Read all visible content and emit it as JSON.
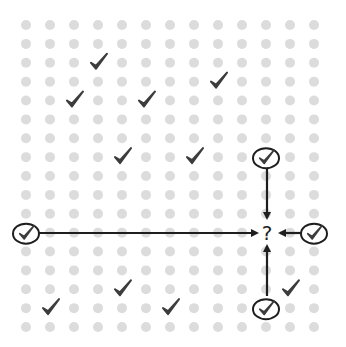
{
  "diagram": {
    "width": 346,
    "height": 347,
    "grid": {
      "cols": 13,
      "rows": 17,
      "x0": 26,
      "dx": 24,
      "y0": 25,
      "dy": 18.875,
      "dot_radius": 5,
      "dot_color": "#dcdcdc"
    },
    "check_color": "#3c3c3c",
    "line_color": "#1e1e1e",
    "checks": [
      {
        "col": 3,
        "row": 2
      },
      {
        "col": 2,
        "row": 4
      },
      {
        "col": 5,
        "row": 4
      },
      {
        "col": 8,
        "row": 3
      },
      {
        "col": 4,
        "row": 7
      },
      {
        "col": 7,
        "row": 7
      },
      {
        "col": 4,
        "row": 14
      },
      {
        "col": 1,
        "row": 15
      },
      {
        "col": 6,
        "row": 15
      },
      {
        "col": 11,
        "row": 14
      }
    ],
    "circled_checks": [
      {
        "id": "top",
        "col": 10,
        "row": 7
      },
      {
        "id": "left",
        "col": 0,
        "row": 11
      },
      {
        "id": "right",
        "col": 12,
        "row": 11
      },
      {
        "id": "bottom",
        "col": 10,
        "row": 15
      }
    ],
    "target": {
      "col": 10,
      "row": 11,
      "label": "?"
    },
    "arrows": [
      {
        "from": "top",
        "x1": 267,
        "y1": 168,
        "x2": 267,
        "y2": 218
      },
      {
        "from": "left",
        "x1": 39,
        "y1": 233,
        "x2": 257,
        "y2": 233
      },
      {
        "from": "right",
        "x1": 303,
        "y1": 233,
        "x2": 280,
        "y2": 233
      },
      {
        "from": "bottom",
        "x1": 267,
        "y1": 296,
        "x2": 267,
        "y2": 246
      }
    ]
  }
}
